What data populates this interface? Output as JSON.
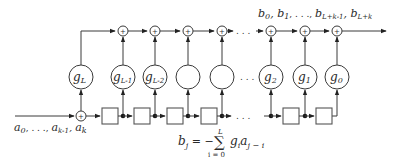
{
  "diagram": {
    "type": "LFSR / linear recurrence shift-register circuit",
    "input_label": {
      "a": "a",
      "s0": "0",
      "mid": ", . . ., ",
      "ak1": "k-1",
      "sep": ", ",
      "ak": "k"
    },
    "output_label": {
      "b0": "0",
      "b1": "1",
      "mid": ", . . ., ",
      "bL1": "L+k-1",
      "bL": "L+k"
    },
    "coefficients": [
      {
        "id": "gL",
        "sub": "L"
      },
      {
        "id": "gL-1",
        "sub": "L-1"
      },
      {
        "id": "gL-2",
        "sub": "L-2"
      },
      {
        "id": "blank1",
        "sub": ""
      },
      {
        "id": "blank2",
        "sub": ""
      },
      {
        "id": "g2",
        "sub": "2"
      },
      {
        "id": "g1",
        "sub": "1"
      },
      {
        "id": "g0",
        "sub": "0"
      }
    ],
    "ellipsis": ". . .",
    "adder_symbol": "+",
    "formula": {
      "lhs": "b",
      "lhs_sub": "j",
      "eq": " = −",
      "sum": "∑",
      "upper": "L",
      "lower": "i = 0",
      "term_g": "g",
      "term_g_sub": "i",
      "term_a": "a",
      "term_a_sub": "j − i"
    }
  }
}
